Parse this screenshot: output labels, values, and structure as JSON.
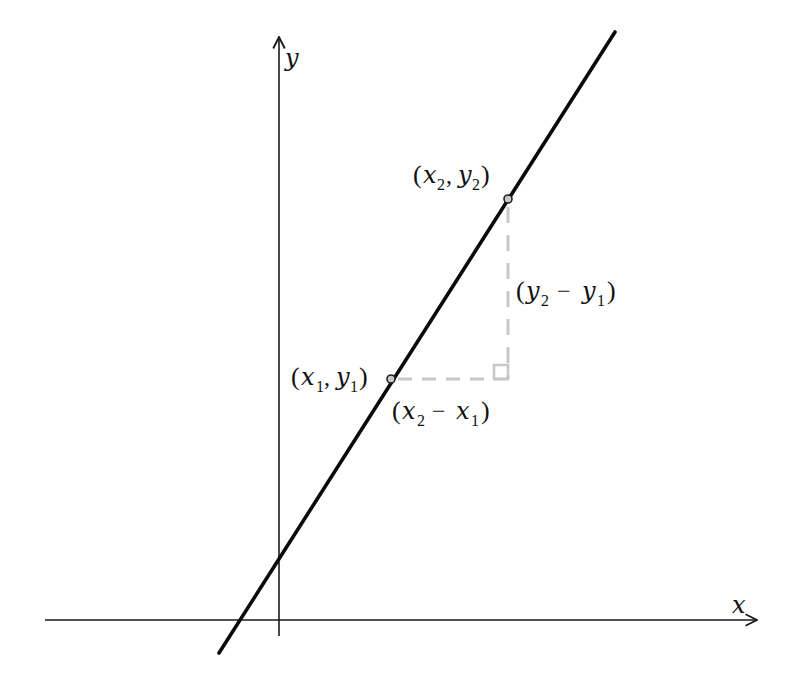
{
  "diagram": {
    "type": "slope-of-line",
    "colors": {
      "axis": "#1a1a1a",
      "line": "#0a0a0a",
      "guide": "#c8c8c8",
      "point_fill": "#c8c8c8",
      "text": "#111111",
      "background": "#ffffff"
    },
    "axes": {
      "x_label": "x",
      "y_label": "y"
    },
    "points": {
      "p1": {
        "label_var_x": "x",
        "label_sub_x": "1",
        "label_var_y": "y",
        "label_sub_y": "1",
        "display": "(x1, y1)"
      },
      "p2": {
        "label_var_x": "x",
        "label_sub_x": "2",
        "label_var_y": "y",
        "label_sub_y": "2",
        "display": "(x2, y2)"
      }
    },
    "differences": {
      "run": {
        "a": "x",
        "a_sub": "2",
        "b": "x",
        "b_sub": "1",
        "op": "−",
        "display": "(x2 − x1)"
      },
      "rise": {
        "a": "y",
        "a_sub": "2",
        "b": "y",
        "b_sub": "1",
        "op": "−",
        "display": "(y2 − y1)"
      }
    },
    "glyphs": {
      "open_paren": "(",
      "close_paren": ")",
      "comma": ","
    }
  }
}
